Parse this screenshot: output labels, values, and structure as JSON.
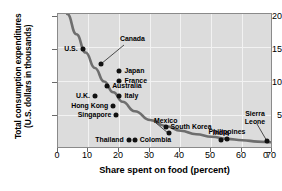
{
  "chart_data": {
    "type": "scatter",
    "title": "",
    "xlabel": "Share spent on food (percent)",
    "ylabel": "Total consumption expenditures (U.S. dollars in thousands)",
    "ylabel_line1": "Total consumption expenditures",
    "ylabel_line2": "(U.S. dollars in thousands)",
    "xlim": [
      0,
      70
    ],
    "ylim": [
      0,
      20
    ],
    "xticks": [
      "0",
      "10",
      "20",
      "30",
      "40",
      "50",
      "60",
      "70"
    ],
    "yticks": [
      "0",
      "5",
      "10",
      "15",
      "20"
    ],
    "grid": true,
    "legend": "none",
    "points": [
      {
        "label": "U.S.",
        "x": 8,
        "y": 14.8,
        "label_pos": "right",
        "leader": false
      },
      {
        "label": "Canada",
        "x": 14,
        "y": 12.6,
        "label_pos": "leader",
        "leader": true
      },
      {
        "label": "Japan",
        "x": 20,
        "y": 11.5,
        "label_pos": "left",
        "leader": false
      },
      {
        "label": "France",
        "x": 20,
        "y": 10.1,
        "label_pos": "left",
        "leader": false
      },
      {
        "label": "Australia",
        "x": 16,
        "y": 9.3,
        "label_pos": "left",
        "leader": false
      },
      {
        "label": "U.K.",
        "x": 12,
        "y": 7.8,
        "label_pos": "right",
        "leader": false
      },
      {
        "label": "Italy",
        "x": 20,
        "y": 7.8,
        "label_pos": "left",
        "leader": false
      },
      {
        "label": "Hong Kong",
        "x": 18,
        "y": 6.4,
        "label_pos": "right",
        "leader": false
      },
      {
        "label": "Singapore",
        "x": 19,
        "y": 5.0,
        "label_pos": "right",
        "leader": false
      },
      {
        "label": "South Korea",
        "x": 35,
        "y": 3.3,
        "label_pos": "left",
        "leader": false
      },
      {
        "label": "Mexico",
        "x": 36,
        "y": 2.3,
        "label_pos": "leader",
        "leader": true
      },
      {
        "label": "Thailand",
        "x": 23,
        "y": 1.3,
        "label_pos": "right",
        "leader": false
      },
      {
        "label": "Colombia",
        "x": 25,
        "y": 1.3,
        "label_pos": "left",
        "leader": false
      },
      {
        "label": "India",
        "x": 53,
        "y": 1.3,
        "label_pos": "above",
        "leader": false
      },
      {
        "label": "Philippines",
        "x": 55,
        "y": 1.5,
        "label_pos": "above",
        "leader": false
      },
      {
        "label": "Sierra Leone",
        "x": 68,
        "y": 1.2,
        "label_pos": "leader",
        "leader": true
      }
    ],
    "fit_curve": {
      "description": "downward-sloping convex trend curve",
      "color": "#6e6e6e",
      "points": [
        [
          3,
          20.0
        ],
        [
          6,
          17.0
        ],
        [
          9,
          14.3
        ],
        [
          12,
          12.0
        ],
        [
          15,
          10.0
        ],
        [
          18,
          8.4
        ],
        [
          21,
          7.0
        ],
        [
          25,
          5.6
        ],
        [
          30,
          4.3
        ],
        [
          35,
          3.4
        ],
        [
          40,
          2.7
        ],
        [
          45,
          2.2
        ],
        [
          50,
          1.8
        ],
        [
          55,
          1.5
        ],
        [
          60,
          1.3
        ],
        [
          65,
          1.1
        ],
        [
          70,
          1.0
        ]
      ]
    }
  }
}
